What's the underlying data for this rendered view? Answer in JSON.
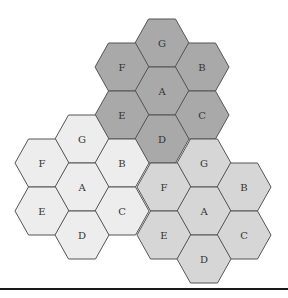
{
  "diagram": {
    "title": "",
    "hex": {
      "radius": 27,
      "half_height": 24,
      "col_step": 40
    },
    "colors": {
      "stroke": "#555555",
      "label": "#333333",
      "rule": "#1a1a1a"
    },
    "clusters": [
      {
        "name": "top-cluster",
        "fill": "#a9a9a9",
        "center": [
          162,
          91
        ],
        "cells": [
          {
            "label": "G",
            "offset": [
              0,
              -2
            ]
          },
          {
            "label": "F",
            "offset": [
              -1,
              -1
            ]
          },
          {
            "label": "B",
            "offset": [
              1,
              -1
            ]
          },
          {
            "label": "A",
            "offset": [
              0,
              0
            ]
          },
          {
            "label": "E",
            "offset": [
              -1,
              1
            ]
          },
          {
            "label": "C",
            "offset": [
              1,
              1
            ]
          },
          {
            "label": "D",
            "offset": [
              0,
              2
            ]
          }
        ]
      },
      {
        "name": "left-cluster",
        "fill": "#ededed",
        "center": [
          82,
          187
        ],
        "cells": [
          {
            "label": "G",
            "offset": [
              0,
              -2
            ]
          },
          {
            "label": "F",
            "offset": [
              -1,
              -1
            ]
          },
          {
            "label": "B",
            "offset": [
              1,
              -1
            ]
          },
          {
            "label": "A",
            "offset": [
              0,
              0
            ]
          },
          {
            "label": "E",
            "offset": [
              -1,
              1
            ]
          },
          {
            "label": "C",
            "offset": [
              1,
              1
            ]
          },
          {
            "label": "D",
            "offset": [
              0,
              2
            ]
          }
        ]
      },
      {
        "name": "right-cluster",
        "fill": "#d6d6d6",
        "center": [
          204,
          211
        ],
        "cells": [
          {
            "label": "G",
            "offset": [
              0,
              -2
            ]
          },
          {
            "label": "F",
            "offset": [
              -1,
              -1
            ]
          },
          {
            "label": "B",
            "offset": [
              1,
              -1
            ]
          },
          {
            "label": "A",
            "offset": [
              0,
              0
            ]
          },
          {
            "label": "E",
            "offset": [
              -1,
              1
            ]
          },
          {
            "label": "C",
            "offset": [
              1,
              1
            ]
          },
          {
            "label": "D",
            "offset": [
              0,
              2
            ]
          }
        ]
      }
    ]
  }
}
